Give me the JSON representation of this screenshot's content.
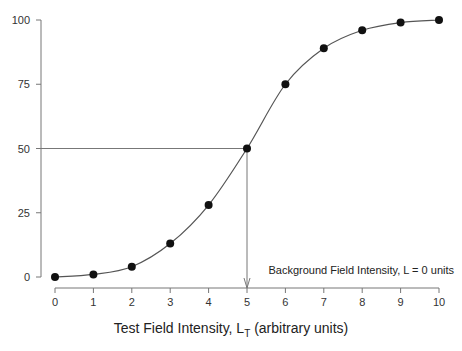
{
  "chart_data": {
    "type": "line",
    "title": "",
    "xlabel": "Test Field Intensity, L",
    "xlabel_sub": "T",
    "xlabel_suffix": " (arbitrary units)",
    "ylabel": "",
    "x": [
      0,
      1,
      2,
      3,
      4,
      5,
      6,
      7,
      8,
      9,
      10
    ],
    "series": [
      {
        "name": "Detection probability",
        "values": [
          0,
          1,
          4,
          13,
          28,
          50,
          75,
          89,
          96,
          99,
          100
        ],
        "marker": "circle",
        "color": "#111111"
      }
    ],
    "xlim": [
      0,
      10
    ],
    "ylim": [
      0,
      100
    ],
    "xticks": [
      "0",
      "1",
      "2",
      "3",
      "4",
      "5",
      "6",
      "7",
      "8",
      "9",
      "10"
    ],
    "yticks": [
      "0",
      "25",
      "50",
      "75",
      "100"
    ],
    "grid": false,
    "legend": "none",
    "annotations": [
      {
        "text": "Background Field Intensity, L = 0 units",
        "x": 10,
        "y": 5,
        "align": "right"
      },
      {
        "type": "guide-line",
        "from": [
          0,
          50
        ],
        "to": [
          5,
          50
        ]
      },
      {
        "type": "arrow",
        "from": [
          5,
          50
        ],
        "to": [
          5,
          0
        ]
      }
    ]
  }
}
